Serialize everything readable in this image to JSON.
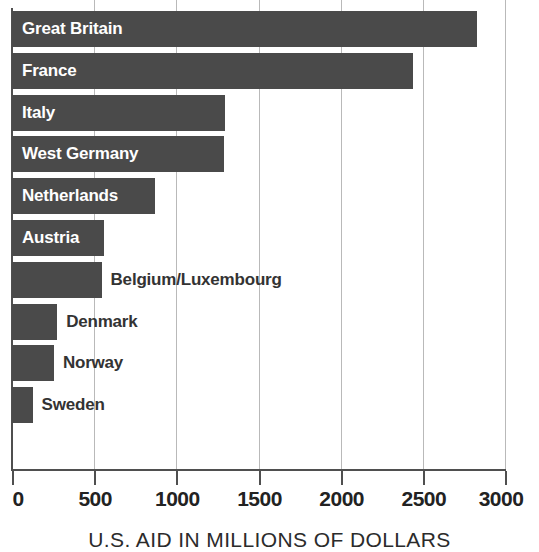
{
  "chart_data": {
    "type": "bar",
    "orientation": "horizontal",
    "title": "",
    "xlabel": "U.S. AID IN MILLIONS OF DOLLARS",
    "ylabel": "",
    "xlim": [
      0,
      3000
    ],
    "grid": true,
    "legend": "none",
    "tick_step": 500,
    "tick_labels": [
      "0",
      "500",
      "1000",
      "1500",
      "2000",
      "2500",
      "3000"
    ],
    "tick_values": [
      0,
      500,
      1000,
      1500,
      2000,
      2500,
      3000
    ],
    "categories": [
      "Great Britain",
      "France",
      "Italy",
      "West Germany",
      "Netherlands",
      "Austria",
      "Belgium/Luxembourg",
      "Denmark",
      "Norway",
      "Sweden"
    ],
    "values": [
      2830,
      2440,
      1295,
      1290,
      870,
      560,
      545,
      275,
      255,
      125
    ],
    "bars": [
      {
        "label": "Great Britain",
        "value": 2830,
        "label_position": "inside"
      },
      {
        "label": "France",
        "value": 2440,
        "label_position": "inside"
      },
      {
        "label": "Italy",
        "value": 1295,
        "label_position": "inside"
      },
      {
        "label": "West Germany",
        "value": 1290,
        "label_position": "inside"
      },
      {
        "label": "Netherlands",
        "value": 870,
        "label_position": "inside"
      },
      {
        "label": "Austria",
        "value": 560,
        "label_position": "inside"
      },
      {
        "label": "Belgium/Luxembourg",
        "value": 545,
        "label_position": "outside"
      },
      {
        "label": "Denmark",
        "value": 275,
        "label_position": "outside"
      },
      {
        "label": "Norway",
        "value": 255,
        "label_position": "outside"
      },
      {
        "label": "Sweden",
        "value": 125,
        "label_position": "outside"
      }
    ],
    "colors": {
      "bar_fill": "#4a4a4a",
      "background": "#ffffff",
      "gridline": "#b9b9b9",
      "axis": "#4f4f4f",
      "label_inside": "#ffffff",
      "label_outside": "#333333",
      "tick_label": "#222222"
    }
  }
}
